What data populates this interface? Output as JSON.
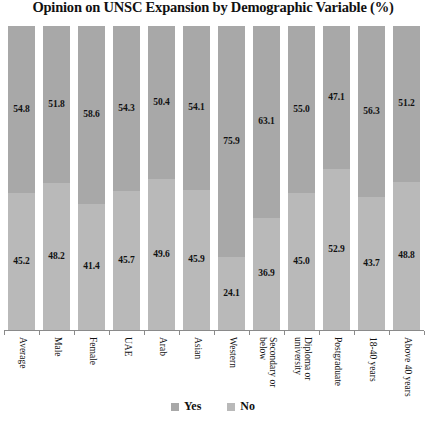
{
  "chart_data": {
    "type": "bar",
    "subtype": "100% stacked column",
    "title": "Opinion on UNSC Expansion by Demographic Variable (%)",
    "xlabel": "",
    "ylabel": "",
    "ylim": [
      0,
      100
    ],
    "grid": false,
    "legend_position": "bottom",
    "categories": [
      "Average",
      "Male",
      "Female",
      "UAE",
      "Arab",
      "Asian",
      "Western",
      "Secondary or below",
      "Diploma or university",
      "Postgraduate",
      "18-40 years",
      "Above 40 years"
    ],
    "category_lines": [
      [
        "Average"
      ],
      [
        "Male"
      ],
      [
        "Female"
      ],
      [
        "UAE"
      ],
      [
        "Arab"
      ],
      [
        "Asian"
      ],
      [
        "Western"
      ],
      [
        "Secondary or",
        "below"
      ],
      [
        "Diploma or",
        "university"
      ],
      [
        "Postgraduate"
      ],
      [
        "18-40 years"
      ],
      [
        "Above 40 years"
      ]
    ],
    "series": [
      {
        "name": "Yes",
        "color": "#a8a8a8",
        "values": [
          54.8,
          51.8,
          58.6,
          54.3,
          50.4,
          54.1,
          75.9,
          63.1,
          55.0,
          47.1,
          56.3,
          51.2
        ],
        "labels": [
          "54.8",
          "51.8",
          "58.6",
          "54.3",
          "50.4",
          "54.1",
          "75.9",
          "63.1",
          "55.0",
          "47.1",
          "56.3",
          "51.2"
        ]
      },
      {
        "name": "No",
        "color": "#b9b9b9",
        "values": [
          45.2,
          48.2,
          41.4,
          45.7,
          49.6,
          45.9,
          24.1,
          36.9,
          45.0,
          52.9,
          43.7,
          48.8
        ],
        "labels": [
          "45.2",
          "48.2",
          "41.4",
          "45.7",
          "49.6",
          "45.9",
          "24.1",
          "36.9",
          "45.0",
          "52.9",
          "43.7",
          "48.8"
        ]
      }
    ]
  },
  "legend": {
    "items": [
      {
        "label": "Yes",
        "color": "#a8a8a8"
      },
      {
        "label": "No",
        "color": "#b9b9b9"
      }
    ]
  }
}
